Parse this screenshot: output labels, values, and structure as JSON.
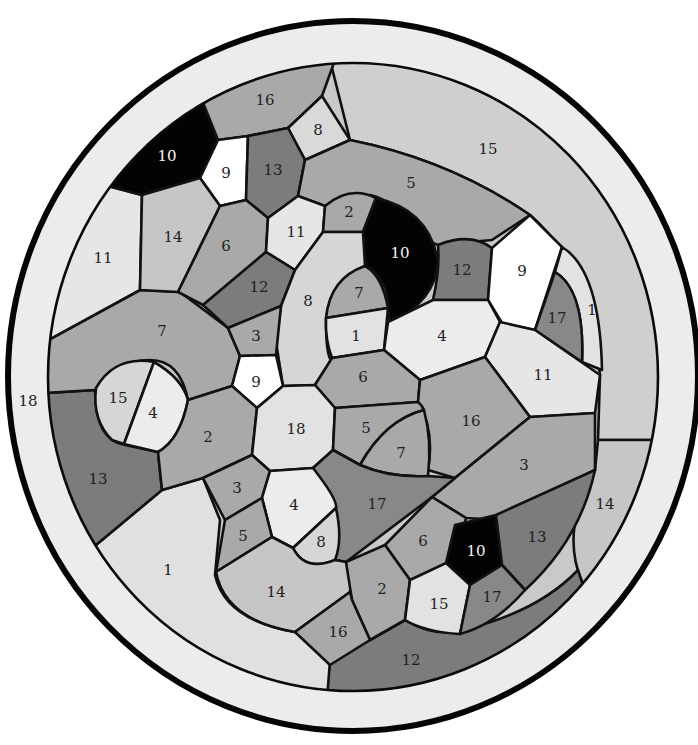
{
  "diagram": {
    "type": "paint-by-number color-blindness style mosaic",
    "outer_ring_label": "18",
    "shades": {
      "black": "#030303",
      "white": "#ffffff",
      "very_light": "#e9e9e9",
      "light": "#d6d6d6",
      "light_mid": "#c6c6c6",
      "mid": "#a9a9a9",
      "mid_dark": "#999999",
      "dark": "#7c7c7c",
      "ring": "#ececec",
      "band": "#cfcfcf"
    },
    "regions": [
      {
        "label": "16",
        "shade": "mid",
        "x": 265,
        "y": 100
      },
      {
        "label": "8",
        "shade": "light",
        "x": 318,
        "y": 130
      },
      {
        "label": "10",
        "shade": "black",
        "x": 167,
        "y": 156
      },
      {
        "label": "9",
        "shade": "white",
        "x": 226,
        "y": 173
      },
      {
        "label": "13",
        "shade": "dark",
        "x": 273,
        "y": 170
      },
      {
        "label": "15",
        "shade": "band",
        "x": 488,
        "y": 149
      },
      {
        "label": "5",
        "shade": "mid",
        "x": 411,
        "y": 183
      },
      {
        "label": "11",
        "shade": "very_light",
        "x": 103,
        "y": 258
      },
      {
        "label": "14",
        "shade": "light_mid",
        "x": 173,
        "y": 237
      },
      {
        "label": "6",
        "shade": "mid",
        "x": 226,
        "y": 246
      },
      {
        "label": "11",
        "shade": "very_light",
        "x": 296,
        "y": 232
      },
      {
        "label": "2",
        "shade": "mid",
        "x": 349,
        "y": 212
      },
      {
        "label": "10",
        "shade": "black",
        "x": 400,
        "y": 253
      },
      {
        "label": "12",
        "shade": "dark",
        "x": 462,
        "y": 270
      },
      {
        "label": "9",
        "shade": "white",
        "x": 522,
        "y": 271
      },
      {
        "label": "1",
        "shade": "very_light",
        "x": 592,
        "y": 310
      },
      {
        "label": "17",
        "shade": "dark",
        "x": 557,
        "y": 318
      },
      {
        "label": "12",
        "shade": "dark",
        "x": 259,
        "y": 287
      },
      {
        "label": "8",
        "shade": "light",
        "x": 308,
        "y": 301
      },
      {
        "label": "7",
        "shade": "mid",
        "x": 359,
        "y": 293
      },
      {
        "label": "1",
        "shade": "very_light",
        "x": 356,
        "y": 336
      },
      {
        "label": "4",
        "shade": "very_light",
        "x": 442,
        "y": 336
      },
      {
        "label": "7",
        "shade": "mid",
        "x": 162,
        "y": 331
      },
      {
        "label": "3",
        "shade": "mid",
        "x": 256,
        "y": 336
      },
      {
        "label": "11",
        "shade": "very_light",
        "x": 543,
        "y": 375
      },
      {
        "label": "9",
        "shade": "white",
        "x": 256,
        "y": 382
      },
      {
        "label": "6",
        "shade": "mid",
        "x": 363,
        "y": 377
      },
      {
        "label": "15",
        "shade": "light",
        "x": 118,
        "y": 398
      },
      {
        "label": "4",
        "shade": "very_light",
        "x": 153,
        "y": 413
      },
      {
        "label": "16",
        "shade": "mid",
        "x": 471,
        "y": 421
      },
      {
        "label": "18",
        "shade": "very_light",
        "x": 296,
        "y": 429
      },
      {
        "label": "5",
        "shade": "mid",
        "x": 366,
        "y": 428
      },
      {
        "label": "2",
        "shade": "mid",
        "x": 208,
        "y": 437
      },
      {
        "label": "7",
        "shade": "mid",
        "x": 401,
        "y": 453
      },
      {
        "label": "13",
        "shade": "dark",
        "x": 98,
        "y": 479
      },
      {
        "label": "3",
        "shade": "mid",
        "x": 524,
        "y": 465
      },
      {
        "label": "3",
        "shade": "mid",
        "x": 237,
        "y": 488
      },
      {
        "label": "4",
        "shade": "very_light",
        "x": 294,
        "y": 505
      },
      {
        "label": "17",
        "shade": "dark",
        "x": 377,
        "y": 504
      },
      {
        "label": "14",
        "shade": "light_mid",
        "x": 605,
        "y": 504
      },
      {
        "label": "8",
        "shade": "light",
        "x": 321,
        "y": 542
      },
      {
        "label": "5",
        "shade": "mid",
        "x": 243,
        "y": 536
      },
      {
        "label": "6",
        "shade": "mid",
        "x": 423,
        "y": 541
      },
      {
        "label": "10",
        "shade": "black",
        "x": 476,
        "y": 551
      },
      {
        "label": "13",
        "shade": "dark",
        "x": 537,
        "y": 537
      },
      {
        "label": "1",
        "shade": "very_light",
        "x": 168,
        "y": 570
      },
      {
        "label": "14",
        "shade": "light_mid",
        "x": 276,
        "y": 592
      },
      {
        "label": "2",
        "shade": "mid",
        "x": 382,
        "y": 589
      },
      {
        "label": "15",
        "shade": "very_light",
        "x": 439,
        "y": 604
      },
      {
        "label": "17",
        "shade": "dark",
        "x": 492,
        "y": 597
      },
      {
        "label": "16",
        "shade": "mid",
        "x": 338,
        "y": 632
      },
      {
        "label": "12",
        "shade": "dark",
        "x": 411,
        "y": 660
      }
    ],
    "outer_label": {
      "label": "18",
      "x": 28,
      "y": 401
    }
  }
}
